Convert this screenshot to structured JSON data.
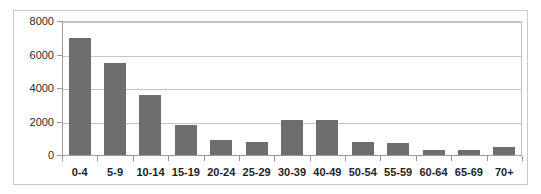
{
  "chart_data": {
    "type": "bar",
    "title": "",
    "subtitle": "",
    "xlabel": "",
    "ylabel": "",
    "categories": [
      "0-4",
      "5-9",
      "10-14",
      "15-19",
      "20-24",
      "25-29",
      "30-39",
      "40-49",
      "50-54",
      "55-59",
      "60-64",
      "65-69",
      "70+"
    ],
    "values": [
      7000,
      5500,
      3600,
      1800,
      900,
      800,
      2100,
      2100,
      800,
      700,
      300,
      300,
      500
    ],
    "ylim": [
      0,
      8000
    ],
    "ytick_labels": [
      "0",
      "2000",
      "4000",
      "6000",
      "8000"
    ],
    "ytick_values": [
      0,
      2000,
      4000,
      6000,
      8000
    ],
    "grid": true,
    "legend": false,
    "legend_position": "none",
    "colors": {
      "bar": "#6e6e6e",
      "gridline": "#c4c4c4",
      "axis": "#9a9a9a",
      "frame": "#c9c9c9",
      "background": "#ffffff",
      "tick_text": "#2b2b2b",
      "category_text": "#1f1f1f"
    }
  }
}
